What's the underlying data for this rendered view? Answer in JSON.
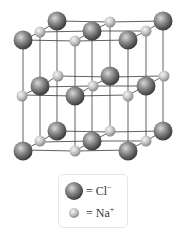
{
  "diagram": {
    "colors": {
      "chloride_sphere": "#8a8a8a",
      "sodium_sphere": "#c8c8c8",
      "lattice_lines": "#3a3a3a",
      "legend_border": "#e6e6e6"
    },
    "layers": [
      {
        "name": "top",
        "chloride": [
          [
            23,
            40
          ],
          [
            57,
            21
          ],
          [
            92,
            31
          ],
          [
            128,
            40
          ],
          [
            163,
            21
          ]
        ],
        "sodium": [
          [
            40,
            32
          ],
          [
            75,
            41
          ],
          [
            110,
            22
          ],
          [
            146,
            31
          ]
        ]
      },
      {
        "name": "middle",
        "chloride": [
          [
            40,
            86
          ],
          [
            75,
            96
          ],
          [
            110,
            76
          ],
          [
            146,
            86
          ]
        ],
        "sodium": [
          [
            22,
            96
          ],
          [
            58,
            76
          ],
          [
            93,
            86
          ],
          [
            128,
            96
          ],
          [
            164,
            76
          ]
        ]
      },
      {
        "name": "bottom",
        "chloride": [
          [
            23,
            151
          ],
          [
            57,
            131
          ],
          [
            92,
            141
          ],
          [
            128,
            151
          ],
          [
            163,
            131
          ]
        ],
        "sodium": [
          [
            40,
            141
          ],
          [
            75,
            151
          ],
          [
            110,
            131
          ],
          [
            146,
            141
          ]
        ]
      }
    ],
    "legend": {
      "items": [
        {
          "symbol": "chloride",
          "label": "= Cl",
          "charge": "−"
        },
        {
          "symbol": "sodium",
          "label": "= Na",
          "charge": "+"
        }
      ]
    }
  }
}
